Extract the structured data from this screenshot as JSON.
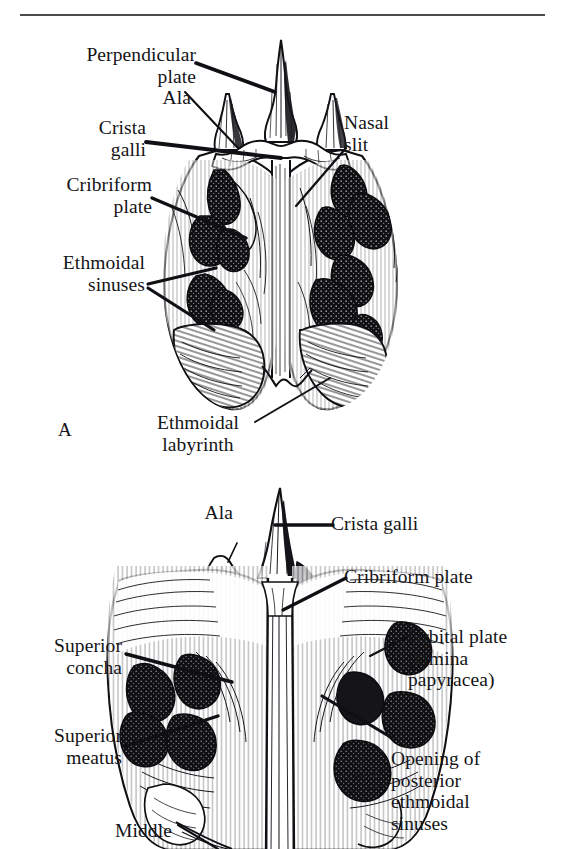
{
  "page": {
    "background_color": "#ffffff",
    "ink_color": "#141417",
    "rule_color": "#4a4a4e",
    "width": 561,
    "height": 849
  },
  "figure_a": {
    "letter": "A",
    "labels": {
      "perpendicular_plate": "Perpendicular\nplate",
      "ala": "Ala",
      "crista_galli": "Crista\ngalli",
      "cribriform_plate": "Cribriform\nplate",
      "ethmoidal_sinuses": "Ethmoidal\nsinuses",
      "nasal_slit": "Nasal\nslit",
      "ethmoidal_labyrinth": "Ethmoidal\nlabyrinth"
    }
  },
  "figure_b": {
    "labels": {
      "ala": "Ala",
      "crista_galli": "Crista galli",
      "cribriform_plate": "Cribriform plate",
      "orbital_plate": "Orbital plate\n(lamina\npapyracea)",
      "superior_concha": "Superior\nconcha",
      "superior_meatus": "Superior\nmeatus",
      "opening_posterior_ethmoidal_sinuses": "Opening of\nposterior\nethmoidal\nsinuses",
      "middle": "Middle"
    }
  }
}
